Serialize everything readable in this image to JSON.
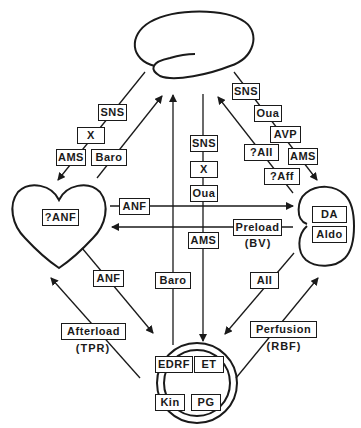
{
  "diagram": {
    "nodes": {
      "brain": {
        "shape": "brain-outline"
      },
      "heart": {
        "shape": "heart-outline",
        "label": "?ANF"
      },
      "kidney": {
        "shape": "kidney-outline",
        "labels": [
          "DA",
          "Aldo"
        ]
      },
      "vessel": {
        "shape": "double-circle",
        "labels": [
          "EDRF",
          "ET",
          "Kin",
          "PG"
        ]
      }
    },
    "edges": {
      "brain_to_heart": {
        "labels": [
          "SNS",
          "X",
          "AMS"
        ]
      },
      "heart_to_brain": {
        "labels": [
          "Baro"
        ]
      },
      "vessel_to_brain": {
        "labels": [
          "Baro"
        ]
      },
      "brain_to_vessel": {
        "labels": [
          "SNS",
          "X",
          "Oua",
          "AMS"
        ]
      },
      "brain_to_kidney": {
        "labels": [
          "SNS",
          "Oua",
          "AVP",
          "AMS"
        ]
      },
      "kidney_to_brain": {
        "labels": [
          "?AII",
          "?Aff"
        ]
      },
      "heart_to_kidney": {
        "labels": [
          "ANF"
        ]
      },
      "kidney_to_heart": {
        "label": "Preload",
        "sublabel": "(BV)"
      },
      "heart_to_vessel": {
        "labels": [
          "ANF"
        ]
      },
      "vessel_to_heart": {
        "label": "Afterload",
        "sublabel": "(TPR)"
      },
      "kidney_to_vessel": {
        "labels": [
          "AII"
        ]
      },
      "vessel_to_kidney": {
        "label": "Perfusion",
        "sublabel": "(RBF)"
      }
    },
    "line_color": "#1a1a1a",
    "background": "#ffffff"
  }
}
